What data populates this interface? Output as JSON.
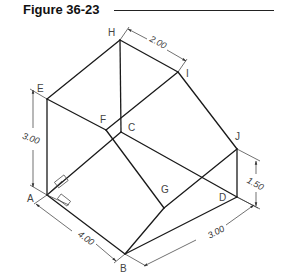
{
  "figure": {
    "title": "Figure 36-23"
  },
  "vertices": {
    "A": "A",
    "B": "B",
    "C": "C",
    "D": "D",
    "E": "E",
    "F": "F",
    "G": "G",
    "H": "H",
    "I": "I",
    "J": "J"
  },
  "dimensions": {
    "top_width": "2.00",
    "left_height": "3.00",
    "front_length": "4.00",
    "right_depth": "3.00",
    "right_height": "1.50"
  },
  "colors": {
    "line": "#1a1a1a",
    "label": "#444444",
    "background": "#ffffff"
  }
}
